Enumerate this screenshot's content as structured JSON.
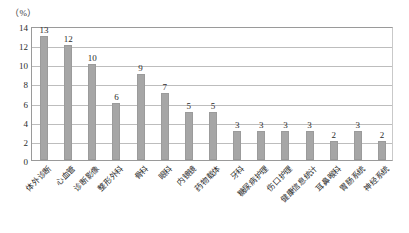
{
  "chart_data": {
    "type": "bar",
    "title": "",
    "subtitle": "",
    "xlabel": "",
    "ylabel": "",
    "unit_label": "（%）",
    "ylim": [
      0,
      14
    ],
    "yticks": [
      0,
      2,
      4,
      6,
      8,
      10,
      12,
      14
    ],
    "grid": true,
    "legend": false,
    "legend_position": "none",
    "categories": [
      "体外诊断",
      "心血管",
      "诊断影像",
      "整形外科",
      "骨科",
      "眼科",
      "内镜镜",
      "药物载体",
      "牙科",
      "糖尿病护理",
      "伤口护理",
      "健康信息统计",
      "耳鼻喉科",
      "胃肠系统",
      "神经系统"
    ],
    "values": [
      13,
      12,
      10,
      6,
      9,
      7,
      5,
      5,
      3,
      3,
      3,
      3,
      2,
      3,
      2
    ],
    "bar_color": "#a6a6a6",
    "grid_color": "#bdbdbd",
    "axis_color": "#9a9a9a"
  }
}
